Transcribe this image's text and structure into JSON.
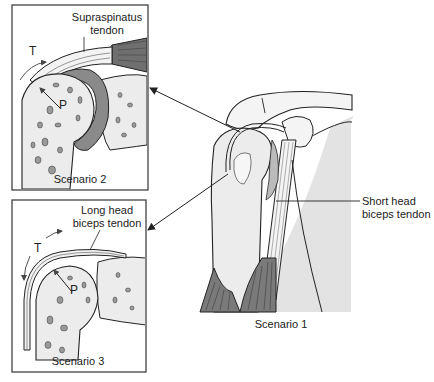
{
  "figure": {
    "type": "anatomical-diagram"
  },
  "main_view": {
    "caption": "Scenario 1",
    "callouts": [
      {
        "id": "short-head",
        "line1": "Short head",
        "line2": "biceps tendon"
      }
    ]
  },
  "inset_top": {
    "caption": "Scenario 2",
    "tendon_label_line1": "Supraspinatus",
    "tendon_label_line2": "tendon",
    "tension_symbol": "T",
    "pressure_symbol": "P"
  },
  "inset_bottom": {
    "caption": "Scenario 3",
    "tendon_label_line1": "Long head",
    "tendon_label_line2": "biceps tendon",
    "tension_symbol": "T",
    "pressure_symbol": "P"
  },
  "colors": {
    "line": "#222222",
    "bone_fill": "#ececec",
    "cartilage": "#8a8a8a",
    "muscle": "#7a7a7a",
    "shade": "#e3e3e3",
    "background": "#ffffff"
  }
}
